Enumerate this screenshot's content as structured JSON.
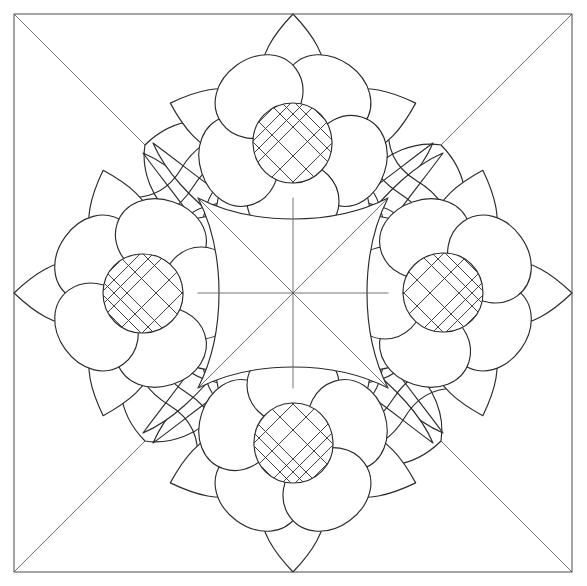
{
  "artwork": {
    "title": "Floral Mandala Line Drawing",
    "kind": "coloring-page-line-art",
    "medium": "pen-and-ink outline",
    "background_color": "#ffffff",
    "ink_color": "#2b2b2b",
    "frame_color": "#4a4a4a",
    "axis_color": "#5a5a5a",
    "canvas": {
      "width": 587,
      "height": 586
    },
    "symmetry": {
      "type": "4-fold rotational",
      "order": 4,
      "mirror_axes": 4
    }
  },
  "frame": {
    "name": "outer border square",
    "x": 14,
    "y": 14,
    "width": 558,
    "height": 558,
    "stroke_width": 1.0
  },
  "construction_lines": {
    "description": "eight radiating guide lines meeting at the composition center",
    "center": {
      "x": 293,
      "y": 293
    },
    "lines": [
      {
        "id": "vertical-axis",
        "from": [
          293,
          14
        ],
        "to": [
          293,
          572
        ]
      },
      {
        "id": "horizontal-axis",
        "from": [
          14,
          293
        ],
        "to": [
          572,
          293
        ]
      },
      {
        "id": "diagonal-nw-se",
        "from": [
          14,
          14
        ],
        "to": [
          572,
          572
        ]
      },
      {
        "id": "diagonal-ne-sw",
        "from": [
          572,
          14
        ],
        "to": [
          14,
          572
        ]
      }
    ]
  },
  "flowers": [
    {
      "id": "flower-north",
      "position": "top",
      "center": [
        293,
        143
      ],
      "rotation_deg": 0
    },
    {
      "id": "flower-east",
      "position": "right",
      "center": [
        443,
        293
      ],
      "rotation_deg": 90
    },
    {
      "id": "flower-south",
      "position": "bottom",
      "center": [
        293,
        443
      ],
      "rotation_deg": 180
    },
    {
      "id": "flower-west",
      "position": "left",
      "center": [
        143,
        293
      ],
      "rotation_deg": 270
    }
  ],
  "flower_anatomy": {
    "core": {
      "name": "crosshatched seed disc",
      "shape": "rounded square / squircle",
      "radius": 38,
      "hatch": {
        "style": "diagonal lattice",
        "lines_per_direction": 5,
        "spacing": 13,
        "angle_deg": 45
      }
    },
    "inner_petals": {
      "name": "rounded inner petal ring",
      "count": 5,
      "shape": "lobed rounded petal"
    },
    "outer_petals": {
      "name": "pointed outer petal ring",
      "count": 5,
      "shape": "lanceolate pointed petal"
    }
  },
  "diagonal_motifs": {
    "name": "corner leaf-and-scroll clusters",
    "count": 4,
    "placement": [
      "northwest",
      "northeast",
      "southeast",
      "southwest"
    ],
    "elements": [
      {
        "id": "paisley-leaf",
        "shape": "teardrop leaf converging to inner point"
      },
      {
        "id": "s-scroll",
        "shape": "double curved scroll band"
      },
      {
        "id": "corner-lobe",
        "shape": "broad rounded corner petal"
      }
    ]
  },
  "center_motif": {
    "name": "concave-sided square medallion",
    "shape": "astroid / four-point cushion",
    "inner_half_width": 95,
    "concavity": 28
  }
}
